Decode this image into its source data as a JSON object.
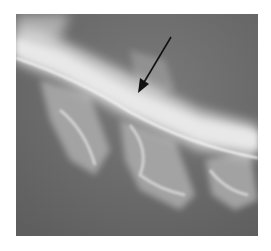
{
  "image": {
    "description": "Lateral radiograph of spinal region with bright curved bony structure crossing diagonally; black arrow pointing to area of interest",
    "background_color": "#6e6e6e",
    "bone_color": "#e6e6e6"
  },
  "annotation": {
    "type": "arrow",
    "color": "#111111",
    "from": [
      171,
      37
    ],
    "to": [
      138,
      92
    ]
  }
}
